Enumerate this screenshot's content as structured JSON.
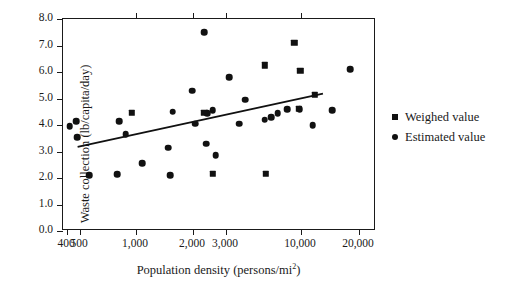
{
  "chart_data": {
    "type": "scatter",
    "title": "",
    "xlabel": "Population density (persons/mi",
    "xlabel_sup": "2",
    "xlabel_tail": ")",
    "ylabel": "Waste collection (lb/capita/day)",
    "xscale": "log",
    "xlim": [
      400,
      20000
    ],
    "ylim": [
      0.0,
      8.0
    ],
    "grid": false,
    "legend_position": "right",
    "xticks": [
      {
        "value": 400,
        "label": "400",
        "px": 66
      },
      {
        "value": 500,
        "label": "500",
        "px": 79
      },
      {
        "value": 1000,
        "label": "1,000",
        "px": 135
      },
      {
        "value": 2000,
        "label": "2,000",
        "px": 192
      },
      {
        "value": 3000,
        "label": "3,000",
        "px": 225
      },
      {
        "value": 10000,
        "label": "10,000",
        "px": 300
      },
      {
        "value": 20000,
        "label": "20,000",
        "px": 358
      }
    ],
    "yticks": [
      {
        "value": 0.0,
        "label": "0.0"
      },
      {
        "value": 1.0,
        "label": "1.0"
      },
      {
        "value": 2.0,
        "label": "2.0"
      },
      {
        "value": 3.0,
        "label": "3.0"
      },
      {
        "value": 4.0,
        "label": "4.0"
      },
      {
        "value": 5.0,
        "label": "5.0"
      },
      {
        "value": 6.0,
        "label": "6.0"
      },
      {
        "value": 7.0,
        "label": "7.0"
      },
      {
        "value": 8.0,
        "label": "8.0"
      }
    ],
    "marker_color": "#111111",
    "series": [
      {
        "name": "Estimated value",
        "marker": "circle",
        "points": [
          {
            "x": 420,
            "y": 3.95
          },
          {
            "x": 470,
            "y": 4.15
          },
          {
            "x": 475,
            "y": 3.55
          },
          {
            "x": 560,
            "y": 2.1
          },
          {
            "x": 790,
            "y": 2.15
          },
          {
            "x": 810,
            "y": 4.15
          },
          {
            "x": 880,
            "y": 3.65
          },
          {
            "x": 1080,
            "y": 2.55
          },
          {
            "x": 1480,
            "y": 3.15
          },
          {
            "x": 1520,
            "y": 2.1
          },
          {
            "x": 1560,
            "y": 4.5
          },
          {
            "x": 1980,
            "y": 5.3
          },
          {
            "x": 2050,
            "y": 4.05
          },
          {
            "x": 2300,
            "y": 7.5
          },
          {
            "x": 2350,
            "y": 3.3
          },
          {
            "x": 2380,
            "y": 4.45
          },
          {
            "x": 2550,
            "y": 4.55
          },
          {
            "x": 2650,
            "y": 2.85
          },
          {
            "x": 3150,
            "y": 5.8
          },
          {
            "x": 3700,
            "y": 4.05
          },
          {
            "x": 4100,
            "y": 4.95
          },
          {
            "x": 5600,
            "y": 4.2
          },
          {
            "x": 6200,
            "y": 4.3
          },
          {
            "x": 6900,
            "y": 4.45
          },
          {
            "x": 8000,
            "y": 4.6
          },
          {
            "x": 9800,
            "y": 4.6
          },
          {
            "x": 11500,
            "y": 4.0
          },
          {
            "x": 14500,
            "y": 4.55
          },
          {
            "x": 18000,
            "y": 6.1
          }
        ]
      },
      {
        "name": "Weighed value",
        "marker": "square",
        "points": [
          {
            "x": 950,
            "y": 4.45
          },
          {
            "x": 2300,
            "y": 4.45
          },
          {
            "x": 2550,
            "y": 2.15
          },
          {
            "x": 5600,
            "y": 6.25
          },
          {
            "x": 5700,
            "y": 2.15
          },
          {
            "x": 9000,
            "y": 7.1
          },
          {
            "x": 9900,
            "y": 6.05
          },
          {
            "x": 9700,
            "y": 4.6
          },
          {
            "x": 11800,
            "y": 5.15
          }
        ]
      }
    ],
    "trendline": {
      "label": "linear fit",
      "x_start": 480,
      "y_start": 3.17,
      "x_end": 13000,
      "y_end": 5.18
    }
  },
  "legend": {
    "items": [
      {
        "label": "Weighed value",
        "marker": "square"
      },
      {
        "label": "Estimated value",
        "marker": "circle"
      }
    ]
  }
}
